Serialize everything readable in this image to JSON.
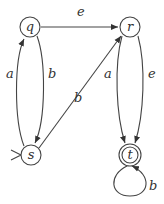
{
  "diagram": {
    "type": "finite-automaton",
    "states": [
      {
        "id": "q",
        "label": "q",
        "accepting": false,
        "initial": false
      },
      {
        "id": "r",
        "label": "r",
        "accepting": false,
        "initial": false
      },
      {
        "id": "s",
        "label": "s",
        "accepting": false,
        "initial": true
      },
      {
        "id": "t",
        "label": "t",
        "accepting": true,
        "initial": false
      }
    ],
    "transitions": [
      {
        "from": "q",
        "to": "r",
        "label": "e"
      },
      {
        "from": "s",
        "to": "q",
        "label": "a"
      },
      {
        "from": "q",
        "to": "s",
        "label": "b"
      },
      {
        "from": "s",
        "to": "r",
        "label": "b"
      },
      {
        "from": "r",
        "to": "t",
        "label": "a"
      },
      {
        "from": "r",
        "to": "t",
        "label": "e"
      },
      {
        "from": "t",
        "to": "t",
        "label": "b"
      }
    ]
  }
}
